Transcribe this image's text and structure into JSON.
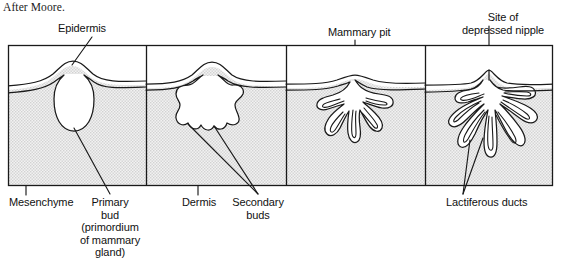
{
  "credit": {
    "text": "After Moore."
  },
  "figure": {
    "colors": {
      "line": "#1a1a1a",
      "mesenchyme_fill": "#e9e9e9",
      "epidermis_fill": "#ffffff",
      "background": "#ffffff"
    },
    "frame": {
      "x": 8,
      "y": 45,
      "width": 545,
      "height": 141,
      "panel_dividers_x": [
        146,
        286,
        425
      ]
    },
    "panels": [
      {
        "index": 1,
        "stage_label": "primary bud",
        "tick_labels": [
          "Epidermis",
          "Mesenchyme",
          "Primary bud (primordium of mammary gland)"
        ]
      },
      {
        "index": 2,
        "stage_label": "secondary buds",
        "tick_labels": [
          "Dermis",
          "Secondary buds"
        ]
      },
      {
        "index": 3,
        "stage_label": "mammary pit",
        "tick_labels": [
          "Mammary pit"
        ]
      },
      {
        "index": 4,
        "stage_label": "lactiferous ducts and depressed nipple",
        "tick_labels": [
          "Site of depressed nipple",
          "Lactiferous ducts"
        ]
      }
    ]
  },
  "labels": {
    "epidermis": "Epidermis",
    "mammary_pit": "Mammary pit",
    "depressed_nipple": "Site of\ndepressed nipple",
    "mesenchyme": "Mesenchyme",
    "primary_bud": "Primary\nbud\n(primordium\nof mammary\ngland)",
    "dermis": "Dermis",
    "secondary_buds": "Secondary\nbuds",
    "lactiferous_ducts": "Lactiferous ducts"
  }
}
